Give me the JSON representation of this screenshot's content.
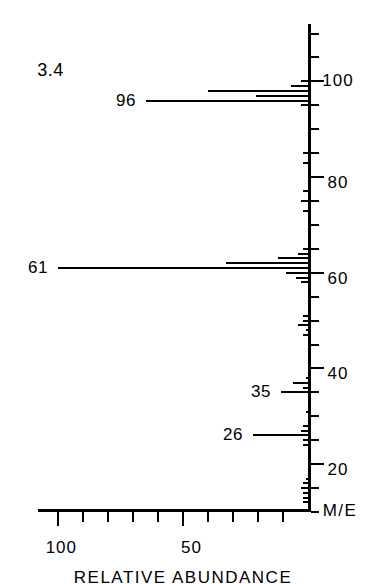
{
  "figure": {
    "annotation": "3.4",
    "x_axis": {
      "title": "M/E",
      "tick_labels": [
        {
          "value": 20,
          "text": "20"
        },
        {
          "value": 40,
          "text": "40"
        },
        {
          "value": 60,
          "text": "60"
        },
        {
          "value": 80,
          "text": "80"
        },
        {
          "value": 100,
          "text": "100"
        }
      ],
      "minor_tick_step": 5,
      "range": [
        10,
        112
      ]
    },
    "y_axis": {
      "title": "RELATIVE ABUNDANCE",
      "tick_labels": [
        {
          "value": 50,
          "text": "50"
        },
        {
          "value": 100,
          "text": "100"
        }
      ],
      "minor_tick_step": 10,
      "range": [
        0,
        108
      ]
    },
    "peak_labels": [
      {
        "text": "26",
        "mz": 26
      },
      {
        "text": "35",
        "mz": 35
      },
      {
        "text": "61",
        "mz": 61
      },
      {
        "text": "96",
        "mz": 96
      }
    ]
  },
  "chart_data": {
    "type": "bar",
    "title": "",
    "subtitle": "3.4",
    "xlabel": "M/E",
    "ylabel": "RELATIVE ABUNDANCE",
    "xlim": [
      10,
      112
    ],
    "ylim": [
      0,
      108
    ],
    "grid": false,
    "legend": "none",
    "categories": [
      12,
      13,
      14,
      15,
      16,
      17,
      24,
      25,
      26,
      27,
      28,
      31,
      35,
      36,
      37,
      38,
      47,
      48,
      49,
      50,
      51,
      58,
      59,
      60,
      61,
      62,
      63,
      64,
      65,
      73,
      75,
      77,
      83,
      85,
      95,
      96,
      97,
      98,
      99,
      100
    ],
    "values": [
      2,
      2,
      2,
      3,
      2,
      1,
      2,
      2,
      22,
      3,
      2,
      1,
      11,
      2,
      6,
      1,
      2,
      1,
      4,
      2,
      2,
      3,
      5,
      9,
      100,
      33,
      12,
      4,
      2,
      2,
      3,
      2,
      2,
      2,
      3,
      65,
      21,
      40,
      7,
      3
    ],
    "labeled_peaks": [
      {
        "mz": 26,
        "label": "26",
        "intensity": 22
      },
      {
        "mz": 35,
        "label": "35",
        "intensity": 11
      },
      {
        "mz": 61,
        "label": "61",
        "intensity": 100
      },
      {
        "mz": 96,
        "label": "96",
        "intensity": 65
      }
    ],
    "base_peak": {
      "mz": 61,
      "intensity": 100
    }
  }
}
